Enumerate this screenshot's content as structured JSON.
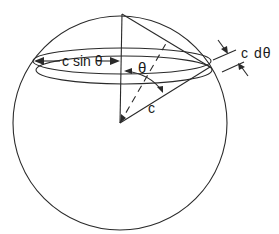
{
  "diagram": {
    "labels": {
      "radius_horizontal": "c sin θ",
      "polar_angle": "θ",
      "radius": "c",
      "arc_width": "c dθ"
    },
    "colors": {
      "stroke": "#2a2a2a",
      "background": "#ffffff"
    }
  }
}
